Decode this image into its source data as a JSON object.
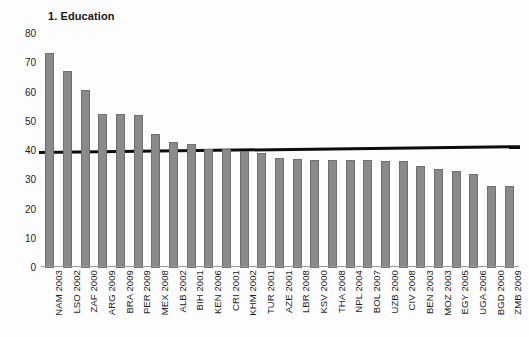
{
  "chart_data": {
    "type": "bar",
    "title": "1. Education",
    "xlabel": "",
    "ylabel": "",
    "ylim": [
      0,
      80
    ],
    "yticks": [
      0,
      10,
      20,
      30,
      40,
      50,
      60,
      70,
      80
    ],
    "grid": false,
    "legend": null,
    "bar_color": "#8a8a8a",
    "bar_edge_color": "#6f6f6f",
    "reference_line": {
      "name": "reference-line",
      "color": "#0d0d0d",
      "value_left": 40.0,
      "value_right": 42.0,
      "style": "solid",
      "width_px": 3
    },
    "categories": [
      "NAM 2003",
      "LSO 2002",
      "ZAF 2000",
      "ARG 2009",
      "BRA 2009",
      "PER 2009",
      "MEX 2008",
      "ALB 2002",
      "BIH 2001",
      "KEN 2006",
      "CRI 2001",
      "KHM 2002",
      "TUR 2001",
      "AZE 2001",
      "LBR 2008",
      "KSV 2000",
      "THA 2008",
      "NPL 2004",
      "BOL 2007",
      "UZB 2000",
      "CIV 2008",
      "BEN 2003",
      "MOZ 2003",
      "EGY 2005",
      "UGA 2006",
      "BGD 2000",
      "ZMB 2009"
    ],
    "values": [
      73.5,
      67.5,
      60.8,
      52.5,
      52.5,
      52.2,
      45.8,
      43.0,
      42.4,
      40.7,
      40.7,
      40.0,
      39.3,
      37.6,
      37.3,
      37.0,
      36.9,
      36.8,
      36.8,
      36.7,
      36.5,
      34.8,
      33.7,
      33.2,
      32.2,
      28.2,
      27.9
    ]
  }
}
